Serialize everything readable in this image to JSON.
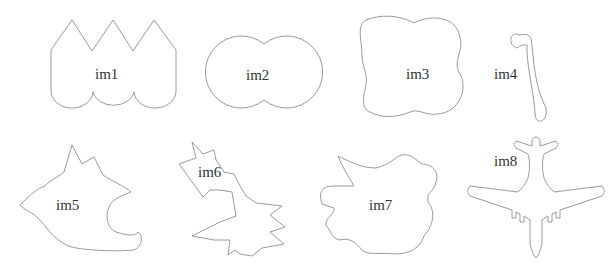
{
  "figure": {
    "stroke_color": "#9a9a9a",
    "background_color": "#ffffff",
    "text_color": "#333333",
    "shapes": [
      {
        "id": "im1",
        "label": "im1",
        "description": "three-peaked crown shape with scalloped bottom"
      },
      {
        "id": "im2",
        "label": "im2",
        "description": "two overlapping circles"
      },
      {
        "id": "im3",
        "label": "im3",
        "description": "rounded four-lobed square"
      },
      {
        "id": "im4",
        "label": "im4",
        "description": "thin hook-shaped bar"
      },
      {
        "id": "im5",
        "label": "im5",
        "description": "irregular blob with spikes"
      },
      {
        "id": "im6",
        "label": "im6",
        "description": "irregular jagged shape"
      },
      {
        "id": "im7",
        "label": "im7",
        "description": "irregular lumpy shape"
      },
      {
        "id": "im8",
        "label": "im8",
        "description": "airplane silhouette"
      }
    ]
  }
}
